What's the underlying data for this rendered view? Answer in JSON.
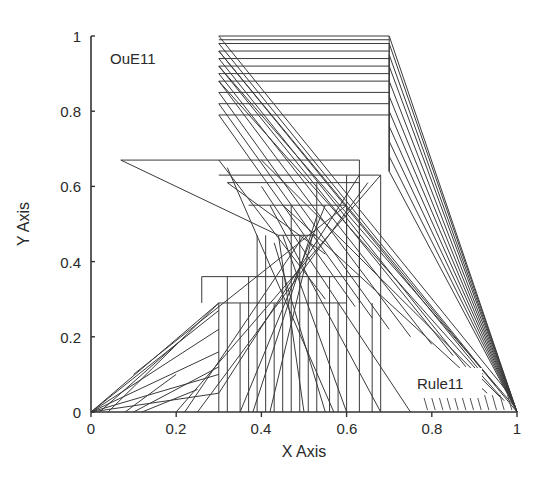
{
  "chart_data": {
    "type": "line",
    "title": "",
    "xlabel": "X Axis",
    "ylabel": "Y Axis",
    "xlim": [
      0,
      1
    ],
    "ylim": [
      0,
      1
    ],
    "grid": false,
    "legend": null,
    "x_ticks": [
      "0",
      "0.2",
      "0.4",
      "0.6",
      "0.8",
      "1"
    ],
    "y_ticks": [
      "0",
      "0.2",
      "0.4",
      "0.6",
      "0.8",
      "1"
    ],
    "annotations": [
      {
        "text": "OuE11",
        "x": 0.04,
        "y": 0.93
      },
      {
        "text": "Rule11",
        "x": 0.79,
        "y": 0.07
      }
    ],
    "line_color": "#3a3a3a",
    "series": [
      {
        "name": "top-horizontals",
        "y_values": [
          1.0,
          0.99,
          0.98,
          0.96,
          0.94,
          0.92,
          0.9,
          0.88,
          0.85,
          0.82,
          0.79
        ],
        "x_range": [
          0.3,
          0.7
        ]
      },
      {
        "name": "mid-horizontals",
        "segments": [
          {
            "x": [
              0.07,
              0.63
            ],
            "y": 0.67
          },
          {
            "x": [
              0.3,
              0.68
            ],
            "y": 0.63
          },
          {
            "x": [
              0.32,
              0.63
            ],
            "y": 0.61
          },
          {
            "x": [
              0.37,
              0.6
            ],
            "y": 0.55
          },
          {
            "x": [
              0.44,
              0.53
            ],
            "y": 0.47
          },
          {
            "x": [
              0.26,
              0.63
            ],
            "y": 0.36
          },
          {
            "x": [
              0.3,
              0.6
            ],
            "y": 0.29
          }
        ]
      },
      {
        "name": "left-rays",
        "from": [
          0,
          0
        ],
        "to_points": [
          [
            0.3,
            0.29
          ],
          [
            0.3,
            0.27
          ],
          [
            0.3,
            0.22
          ],
          [
            0.3,
            0.16
          ],
          [
            0.3,
            0.1
          ],
          [
            0.3,
            0.05
          ]
        ]
      },
      {
        "name": "right-convergence",
        "to": [
          1,
          0
        ],
        "from_x": 0.7,
        "from_y": [
          1.0,
          0.98,
          0.95,
          0.92,
          0.88,
          0.84,
          0.8,
          0.76,
          0.72,
          0.68,
          0.64
        ]
      },
      {
        "name": "diagonals-from-left",
        "from_x": 0.3,
        "from_y": [
          1.0,
          0.98,
          0.96,
          0.94,
          0.92,
          0.9,
          0.88,
          0.85,
          0.82,
          0.79,
          0.67
        ],
        "to": [
          [
            0.98,
            0.05
          ],
          [
            0.95,
            0.07
          ],
          [
            0.92,
            0.1
          ],
          [
            0.88,
            0.12
          ],
          [
            0.85,
            0.15
          ],
          [
            0.8,
            0.18
          ],
          [
            0.75,
            0.2
          ],
          [
            0.7,
            0.22
          ],
          [
            0.66,
            0.25
          ],
          [
            0.62,
            0.28
          ],
          [
            0.55,
            0.3
          ]
        ]
      },
      {
        "name": "verticals",
        "x_values": [
          0.3,
          0.32,
          0.35,
          0.37,
          0.39,
          0.41,
          0.43,
          0.45,
          0.47,
          0.49,
          0.51,
          0.53,
          0.56,
          0.58,
          0.6,
          0.63,
          0.66,
          0.68
        ]
      }
    ]
  }
}
